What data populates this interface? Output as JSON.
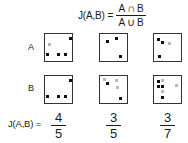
{
  "figure": {
    "title_formula": {
      "lhs": "J(A,B)",
      "equals": "=",
      "numerator": {
        "left": "A",
        "op": "∩",
        "right": "B"
      },
      "denominator": {
        "left": "A",
        "op": "∪",
        "right": "B"
      }
    },
    "row_labels": {
      "a": "A",
      "b": "B"
    },
    "result_label": "J(A,B) =",
    "columns": [
      {
        "name": "column-1",
        "result": {
          "numerator": "4",
          "denominator": "5"
        },
        "set_a_points": [
          {
            "x": 24,
            "y": 3,
            "shade": "dark"
          },
          {
            "x": 3,
            "y": 9,
            "shade": "light"
          },
          {
            "x": 1,
            "y": 19,
            "shade": "dark"
          },
          {
            "x": 12,
            "y": 19,
            "shade": "dark"
          },
          {
            "x": 19,
            "y": 19,
            "shade": "dark"
          }
        ],
        "set_b_points": [
          {
            "x": 24,
            "y": 3,
            "shade": "dark"
          },
          {
            "x": 1,
            "y": 19,
            "shade": "dark"
          },
          {
            "x": 12,
            "y": 19,
            "shade": "dark"
          },
          {
            "x": 19,
            "y": 19,
            "shade": "dark"
          }
        ]
      },
      {
        "name": "column-2",
        "result": {
          "numerator": "3",
          "denominator": "5"
        },
        "set_a_points": [
          {
            "x": 6,
            "y": 6,
            "shade": "dark"
          },
          {
            "x": 15,
            "y": 3,
            "shade": "dark"
          },
          {
            "x": 19,
            "y": 21,
            "shade": "dark"
          }
        ],
        "set_b_points": [
          {
            "x": 6,
            "y": 6,
            "shade": "dark"
          },
          {
            "x": 15,
            "y": 3,
            "shade": "light"
          },
          {
            "x": 16,
            "y": 10,
            "shade": "light"
          },
          {
            "x": 19,
            "y": 21,
            "shade": "dark"
          },
          {
            "x": 3,
            "y": 2,
            "shade": "light"
          }
        ]
      },
      {
        "name": "column-3",
        "result": {
          "numerator": "3",
          "denominator": "7"
        },
        "set_a_points": [
          {
            "x": 3,
            "y": 4,
            "shade": "dark"
          },
          {
            "x": 7,
            "y": 7,
            "shade": "dark"
          },
          {
            "x": 14,
            "y": 8,
            "shade": "light"
          },
          {
            "x": 4,
            "y": 21,
            "shade": "dark"
          }
        ],
        "set_b_points": [
          {
            "x": 3,
            "y": 4,
            "shade": "dark"
          },
          {
            "x": 7,
            "y": 3,
            "shade": "light"
          },
          {
            "x": 7,
            "y": 9,
            "shade": "dark"
          },
          {
            "x": 7,
            "y": 14,
            "shade": "light"
          },
          {
            "x": 7,
            "y": 20,
            "shade": "dark"
          },
          {
            "x": 21,
            "y": 8,
            "shade": "light"
          },
          {
            "x": 3,
            "y": 9,
            "shade": "dark"
          }
        ]
      }
    ],
    "colors": {
      "background": "#ffffff",
      "stroke": "#333333",
      "text": "#1a1a1a",
      "point_dark": "#111111",
      "point_light": "#b9b9b9"
    }
  }
}
